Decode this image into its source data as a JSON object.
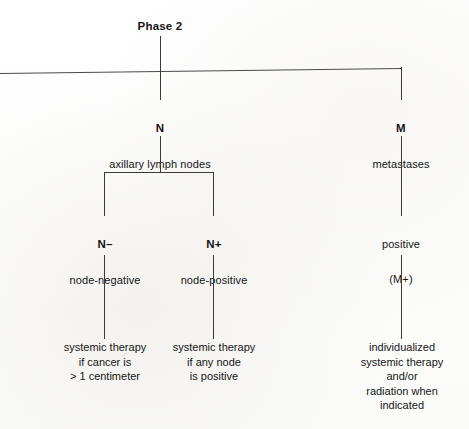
{
  "diagram": {
    "title": "Phase 2",
    "type": "flowchart",
    "nodes": {
      "n": {
        "code": "N",
        "desc": "axillary lymph nodes"
      },
      "m": {
        "code": "M",
        "desc": "metastases"
      },
      "n_minus": {
        "code": "N–",
        "desc": "node-negative"
      },
      "n_plus": {
        "code": "N+",
        "desc": "node-positive"
      },
      "m_positive": {
        "code": "positive",
        "desc": "(M+)"
      }
    },
    "leaves": {
      "n_minus_outcome": "systemic therapy\nif cancer is\n> 1 centimeter",
      "n_plus_outcome": "systemic therapy\nif any node\nis positive",
      "m_outcome": "individualized\nsystemic therapy\nand/or\nradiation when\nindicated"
    },
    "colors": {
      "background": "#fefefe",
      "text": "#151515",
      "stroke": "#3a3a3a"
    }
  }
}
